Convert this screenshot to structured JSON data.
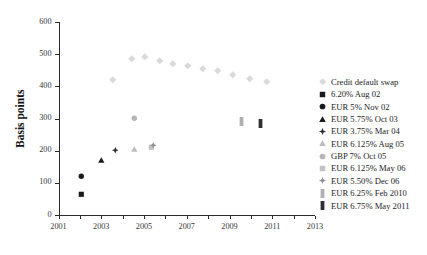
{
  "chart_data": {
    "type": "scatter",
    "title": "",
    "xlabel": "",
    "ylabel": "Basis points",
    "xlim": [
      2001,
      2013
    ],
    "ylim": [
      0,
      600
    ],
    "yticks": [
      0,
      100,
      200,
      300,
      400,
      500,
      600
    ],
    "xticks": [
      2001,
      2003,
      2005,
      2007,
      2009,
      2011,
      2013
    ],
    "xticks_minor": [
      2002,
      2004,
      2006,
      2008,
      2010,
      2012
    ],
    "grid": false,
    "legend_position": "right",
    "series": [
      {
        "name": "Credit default swap",
        "marker": "diamond",
        "color": "#d9d9d9",
        "points": [
          {
            "x": 2003.55,
            "y": 422
          },
          {
            "x": 2004.45,
            "y": 487
          },
          {
            "x": 2005.05,
            "y": 492
          },
          {
            "x": 2005.75,
            "y": 478
          },
          {
            "x": 2006.35,
            "y": 470
          },
          {
            "x": 2007.05,
            "y": 464
          },
          {
            "x": 2007.75,
            "y": 456
          },
          {
            "x": 2008.45,
            "y": 448
          },
          {
            "x": 2009.15,
            "y": 437
          },
          {
            "x": 2009.95,
            "y": 425
          },
          {
            "x": 2010.75,
            "y": 414
          }
        ]
      },
      {
        "name": "6.20% Aug 02",
        "marker": "square",
        "color": "#1a1a1a",
        "points": [
          {
            "x": 2002.05,
            "y": 65
          }
        ]
      },
      {
        "name": "EUR 5% Nov 02",
        "marker": "circle",
        "color": "#1a1a1a",
        "points": [
          {
            "x": 2002.05,
            "y": 120
          }
        ]
      },
      {
        "name": "EUR 5.75% Oct 03",
        "marker": "triangle",
        "color": "#1a1a1a",
        "points": [
          {
            "x": 2003.0,
            "y": 170
          }
        ]
      },
      {
        "name": "EUR 3.75% Mar 04",
        "marker": "star4",
        "color": "#2e2e2e",
        "points": [
          {
            "x": 2003.65,
            "y": 200
          }
        ]
      },
      {
        "name": "EUR 6.125% Aug 05",
        "marker": "triangle",
        "color": "#bdbdbd",
        "points": [
          {
            "x": 2004.55,
            "y": 205
          }
        ]
      },
      {
        "name": "GBP 7% Oct 05",
        "marker": "circle",
        "color": "#b5b5b5",
        "points": [
          {
            "x": 2004.55,
            "y": 300
          }
        ]
      },
      {
        "name": "EUR 6.125% May 06",
        "marker": "square",
        "color": "#c2c2c2",
        "points": [
          {
            "x": 2005.35,
            "y": 212
          }
        ]
      },
      {
        "name": "EUR 5.50% Dec 06",
        "marker": "star4",
        "color": "#8f8f8f",
        "points": [
          {
            "x": 2005.45,
            "y": 218
          }
        ]
      },
      {
        "name": "EUR 6.25% Feb 2010",
        "marker": "bar",
        "color": "#b0b0b0",
        "points": [
          {
            "x": 2009.55,
            "y": 292
          }
        ]
      },
      {
        "name": "EUR 6.75% May 2011",
        "marker": "bar",
        "color": "#303030",
        "points": [
          {
            "x": 2010.45,
            "y": 283
          }
        ]
      }
    ]
  },
  "axes": {
    "ylabel": "Basis points",
    "ytick_labels": [
      "0",
      "100",
      "200",
      "300",
      "400",
      "500",
      "600"
    ],
    "xtick_labels": [
      "2001",
      "2003",
      "2005",
      "2007",
      "2009",
      "2011",
      "2013"
    ]
  },
  "legend": {
    "items": [
      {
        "label": "Credit default swap",
        "marker": "diamond",
        "color": "#d9d9d9"
      },
      {
        "label": "6.20% Aug 02",
        "marker": "square",
        "color": "#1a1a1a"
      },
      {
        "label": "EUR 5% Nov 02",
        "marker": "circle",
        "color": "#1a1a1a"
      },
      {
        "label": "EUR 5.75% Oct 03",
        "marker": "triangle",
        "color": "#1a1a1a"
      },
      {
        "label": "EUR 3.75% Mar 04",
        "marker": "star4",
        "color": "#2e2e2e"
      },
      {
        "label": "EUR 6.125% Aug 05",
        "marker": "triangle",
        "color": "#bdbdbd"
      },
      {
        "label": "GBP 7% Oct 05",
        "marker": "circle",
        "color": "#b5b5b5"
      },
      {
        "label": "EUR 6.125% May 06",
        "marker": "square",
        "color": "#c2c2c2"
      },
      {
        "label": "EUR 5.50% Dec 06",
        "marker": "star4",
        "color": "#8f8f8f"
      },
      {
        "label": "EUR 6.25% Feb 2010",
        "marker": "bar",
        "color": "#b0b0b0"
      },
      {
        "label": "EUR 6.75% May 2011",
        "marker": "bar",
        "color": "#303030"
      }
    ]
  }
}
